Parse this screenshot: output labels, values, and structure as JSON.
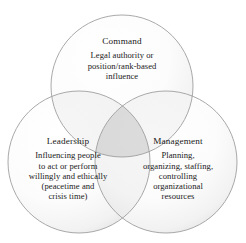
{
  "diagram": {
    "type": "venn-3-circle",
    "background_color": "#ffffff",
    "circle_stroke_color": "#9a9a9a",
    "circle_fill_color": "#fafafa",
    "text_color": "#1a1a1a",
    "sets": [
      {
        "id": "command",
        "title": "Command",
        "lines": [
          "Legal authority or",
          "position/rank-based",
          "influence"
        ]
      },
      {
        "id": "leadership",
        "title": "Leadership",
        "lines": [
          "Influencing people",
          "to act or perform",
          "willingly and ethically",
          "(peacetime and",
          "crisis time)"
        ]
      },
      {
        "id": "management",
        "title": "Management",
        "lines": [
          "Planning,",
          "organizing, staffing,",
          "controlling",
          "organizational",
          "resources"
        ]
      }
    ]
  }
}
